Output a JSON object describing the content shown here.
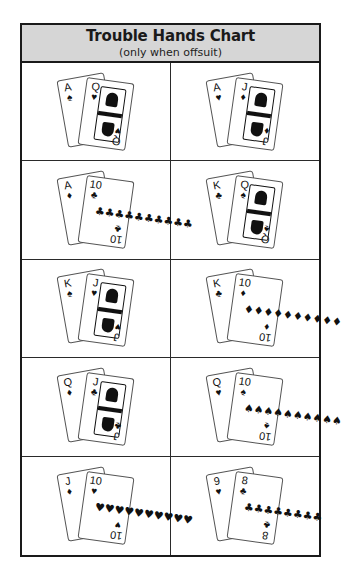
{
  "header": {
    "title": "Trouble Hands Chart",
    "subtitle": "(only when offsuit)"
  },
  "hands": [
    {
      "name": "ace-queen",
      "back": {
        "rank": "A",
        "suit": "♠"
      },
      "front": {
        "rank": "Q",
        "suit": "♥",
        "type": "face"
      }
    },
    {
      "name": "ace-jack",
      "back": {
        "rank": "A",
        "suit": "♥"
      },
      "front": {
        "rank": "J",
        "suit": "♦",
        "type": "face"
      }
    },
    {
      "name": "ace-ten",
      "back": {
        "rank": "A",
        "suit": "♦"
      },
      "front": {
        "rank": "10",
        "suit": "♣",
        "type": "pips",
        "pips": "♣♣♣♣♣♣♣♣♣♣"
      }
    },
    {
      "name": "king-queen",
      "back": {
        "rank": "K",
        "suit": "♣"
      },
      "front": {
        "rank": "Q",
        "suit": "♠",
        "type": "face"
      }
    },
    {
      "name": "king-jack",
      "back": {
        "rank": "K",
        "suit": "♠"
      },
      "front": {
        "rank": "J",
        "suit": "♥",
        "type": "face"
      }
    },
    {
      "name": "king-ten",
      "back": {
        "rank": "K",
        "suit": "♣"
      },
      "front": {
        "rank": "10",
        "suit": "♦",
        "type": "pips",
        "pips": "♦♦♦♦♦♦♦♦♦♦"
      }
    },
    {
      "name": "queen-jack",
      "back": {
        "rank": "Q",
        "suit": "♦"
      },
      "front": {
        "rank": "J",
        "suit": "♣",
        "type": "face"
      }
    },
    {
      "name": "queen-ten",
      "back": {
        "rank": "Q",
        "suit": "♥"
      },
      "front": {
        "rank": "10",
        "suit": "♠",
        "type": "pips",
        "pips": "♠♠♠♠♠♠♠♠♠♠"
      }
    },
    {
      "name": "jack-ten",
      "back": {
        "rank": "J",
        "suit": "♦"
      },
      "front": {
        "rank": "10",
        "suit": "♥",
        "type": "pips",
        "pips": "♥♥♥♥♥♥♥♥♥♥"
      }
    },
    {
      "name": "nine-eight",
      "back": {
        "rank": "9",
        "suit": "♥"
      },
      "front": {
        "rank": "8",
        "suit": "♣",
        "type": "pips",
        "pips": "♣♣♣♣♣♣♣♣"
      }
    }
  ]
}
